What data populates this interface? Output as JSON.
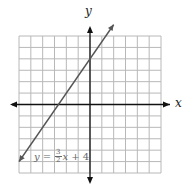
{
  "chart_data": {
    "type": "line",
    "title": "",
    "xlabel": "x",
    "ylabel": "y",
    "xlim": [
      -6,
      6
    ],
    "ylim": [
      -6,
      6
    ],
    "grid": true,
    "grid_step": 1,
    "legend": "none",
    "series": [
      {
        "name": "y = 3/2 x + 4",
        "equation": "y = (3/2)x + 4",
        "slope": 1.5,
        "intercept": 4,
        "x": [
          -6,
          2
        ],
        "y": [
          -5,
          7
        ],
        "arrows": "both",
        "color": "#555555"
      }
    ],
    "annotations": [
      {
        "text": "y = 3/2 x + 4",
        "position": "lower-left",
        "x": -5.5,
        "y": -5
      }
    ]
  },
  "labels": {
    "x_axis": "x",
    "y_axis": "y",
    "equation": {
      "lhs": "y",
      "equals": "=",
      "numerator": "3",
      "denominator": "2",
      "var": "x",
      "rest": "+ 4"
    }
  },
  "colors": {
    "grid": "#b8b8b8",
    "axes": "#111111",
    "line": "#555555"
  }
}
